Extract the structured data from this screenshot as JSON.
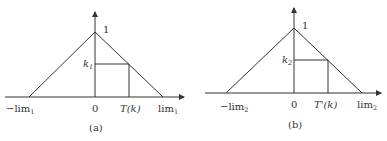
{
  "panels": [
    {
      "caption": "(a)",
      "peak_label": "1",
      "k_label": "k",
      "k_sub": "1",
      "neg_lim_label": "−lim",
      "neg_lim_sub": "1",
      "origin_label": "0",
      "t_label": "T(k)",
      "lim_label": "lim",
      "lim_sub": "1"
    },
    {
      "caption": "(b)",
      "peak_label": "1",
      "k_label": "k",
      "k_sub": "2",
      "neg_lim_label": "−lim",
      "neg_lim_sub": "2",
      "origin_label": "0",
      "t_label": "T'(k)",
      "lim_label": "lim",
      "lim_sub": "2"
    }
  ],
  "colors": {
    "line": "#333333",
    "background": "#ffffff"
  }
}
